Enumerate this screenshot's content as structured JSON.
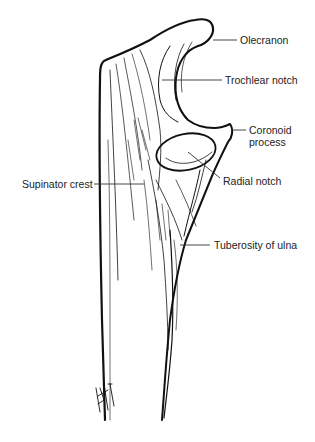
{
  "figure": {
    "labels": {
      "olecranon": "Olecranon",
      "trochlear_notch": "Trochlear notch",
      "coronoid_line1": "Coronoid",
      "coronoid_line2": "process",
      "supinator_crest": "Supinator crest",
      "radial_notch": "Radial notch",
      "tuberosity": "Tuberosity of ulna"
    },
    "signature": "BRITEN",
    "colors": {
      "ink": "#111111",
      "leader": "#333333",
      "text": "#222222",
      "background": "#ffffff"
    }
  }
}
